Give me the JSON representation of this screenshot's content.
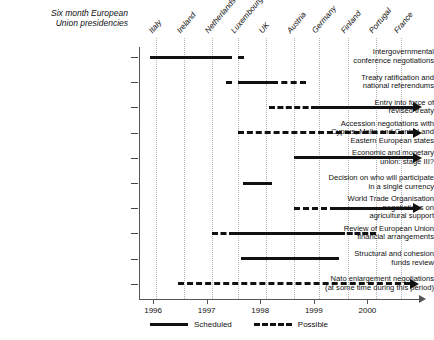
{
  "header": {
    "title": "Six month European\nUnion presidencies",
    "title_line1": "Six month European",
    "title_line2": "Union presidencies"
  },
  "chart_data": {
    "type": "bar",
    "title": "Six month European Union presidencies",
    "xlabel": "",
    "ylabel": "",
    "xlim": [
      1995.75,
      2000.75
    ],
    "grid": true,
    "legend_position": "bottom",
    "legend": [
      {
        "label": "Scheduled",
        "style": "solid"
      },
      {
        "label": "Possible",
        "style": "dashed"
      }
    ],
    "x_tick_labels": [
      "1996",
      "1997",
      "1998",
      "1999",
      "2000"
    ],
    "x_tick_values": [
      1996.0,
      1996.95,
      1997.9,
      1998.85,
      1999.8
    ],
    "presidencies": [
      {
        "country": "Italy",
        "x": 1996.05
      },
      {
        "country": "Ireland",
        "x": 1996.55
      },
      {
        "country": "Netherlands",
        "x": 1997.05
      },
      {
        "country": "Luxembourg",
        "x": 1997.5
      },
      {
        "country": "UK",
        "x": 1998.0
      },
      {
        "country": "Austria",
        "x": 1998.5
      },
      {
        "country": "Germany",
        "x": 1998.95
      },
      {
        "country": "Finland",
        "x": 1999.45
      },
      {
        "country": "Portugal",
        "x": 1999.95
      },
      {
        "country": "France",
        "x": 2000.4
      }
    ],
    "categories": [
      "Intergovernmental conference negotiations",
      "Treaty ratification and national referendums",
      "Entry into force of revised treaty",
      "Accession negotiations with Cyprus, Malta and Central and Eastern European states",
      "Economic and monetary union: stage III?",
      "Decision on who will participate in a single currency",
      "World Trade Organisation negotiations on agricultural support",
      "Review of European Union financial arrangements",
      "Structural and cohesion funds review",
      "Nato enlargement negotiations (at some time during this period)"
    ],
    "rows": [
      {
        "label_lines": [
          "Intergovernmental",
          "conference negotiations"
        ],
        "segments": [
          {
            "start": 1995.95,
            "end": 1997.3,
            "style": "scheduled"
          },
          {
            "start": 1997.3,
            "end": 1997.62,
            "style": "possible"
          }
        ],
        "arrow": false
      },
      {
        "label_lines": [
          "Treaty ratification and",
          "national referendums"
        ],
        "segments": [
          {
            "start": 1997.3,
            "end": 1997.62,
            "style": "possible"
          },
          {
            "start": 1997.62,
            "end": 1998.1,
            "style": "scheduled"
          },
          {
            "start": 1998.1,
            "end": 1998.72,
            "style": "possible"
          }
        ],
        "arrow": false
      },
      {
        "label_lines": [
          "Entry into force of",
          "revised treaty"
        ],
        "segments": [
          {
            "start": 1998.05,
            "end": 1998.9,
            "style": "possible"
          },
          {
            "start": 1998.9,
            "end": 2000.6,
            "style": "scheduled"
          }
        ],
        "arrow": true,
        "arrow_style": "scheduled"
      },
      {
        "label_lines": [
          "Accession negotiations with",
          "Cyprus, Malta and Central and",
          "Eastern European states"
        ],
        "segments": [
          {
            "start": 1997.5,
            "end": 2000.6,
            "style": "possible"
          }
        ],
        "arrow": true,
        "arrow_style": "possible"
      },
      {
        "label_lines": [
          "Economic and monetary",
          "union: stage III?"
        ],
        "segments": [
          {
            "start": 1998.5,
            "end": 2000.6,
            "style": "scheduled"
          }
        ],
        "arrow": true,
        "arrow_style": "scheduled"
      },
      {
        "label_lines": [
          "Decision on who will participate",
          "in a single currency"
        ],
        "segments": [
          {
            "start": 1997.6,
            "end": 1998.1,
            "style": "scheduled"
          }
        ],
        "arrow": false
      },
      {
        "label_lines": [
          "World Trade Organisation",
          "negotiations on",
          "agricultural support"
        ],
        "segments": [
          {
            "start": 1998.5,
            "end": 1999.25,
            "style": "possible"
          },
          {
            "start": 1999.25,
            "end": 2000.6,
            "style": "scheduled"
          }
        ],
        "arrow": true,
        "arrow_style": "scheduled"
      },
      {
        "label_lines": [
          "Review of European Union",
          "financial arrangements"
        ],
        "segments": [
          {
            "start": 1997.05,
            "end": 1997.45,
            "style": "possible"
          },
          {
            "start": 1997.45,
            "end": 1999.3,
            "style": "scheduled"
          },
          {
            "start": 1999.3,
            "end": 1999.95,
            "style": "possible"
          }
        ],
        "arrow": false
      },
      {
        "label_lines": [
          "Structural and cohesion",
          "funds review"
        ],
        "segments": [
          {
            "start": 1997.55,
            "end": 1999.3,
            "style": "scheduled"
          }
        ],
        "arrow": false
      },
      {
        "label_lines": [
          "Nato enlargement negotiations",
          "(at some time during this period)"
        ],
        "segments": [
          {
            "start": 1996.45,
            "end": 2000.55,
            "style": "possible"
          }
        ],
        "arrow": true,
        "arrow_style": "possible"
      }
    ]
  },
  "colors": {
    "bar": "#111111",
    "grid": "#b2b2b2",
    "axis": "#555555",
    "background": "#ffffff"
  }
}
